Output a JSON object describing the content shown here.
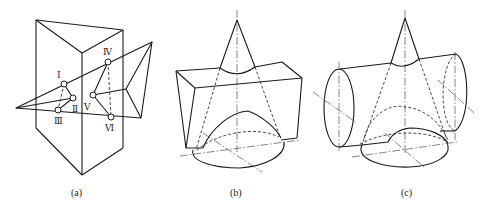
{
  "figure": {
    "panels": [
      {
        "id": "a",
        "caption": "(a)",
        "description": "Triangular prism intersected by a triangular plane; intersection points labeled",
        "point_labels": [
          "Ⅰ",
          "Ⅱ",
          "Ⅲ",
          "Ⅳ",
          "Ⅴ",
          "Ⅵ"
        ]
      },
      {
        "id": "b",
        "caption": "(b)",
        "description": "Cone intersecting a rectangular block (prism)"
      },
      {
        "id": "c",
        "caption": "(c)",
        "description": "Cone intersecting a horizontal cylinder"
      }
    ]
  }
}
